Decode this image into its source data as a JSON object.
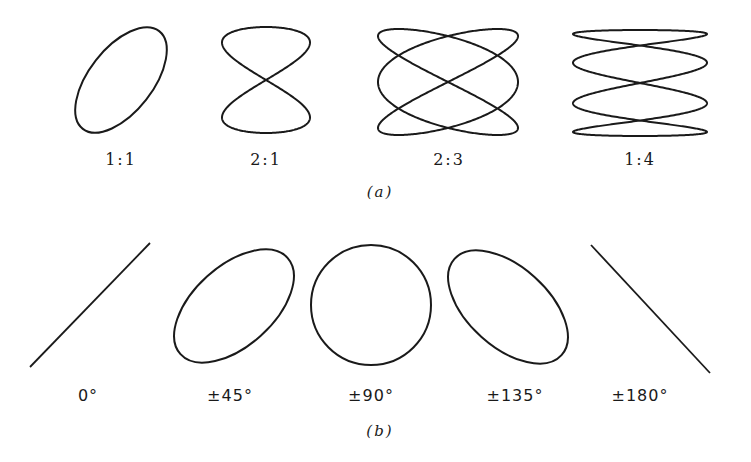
{
  "figure": {
    "part_a": {
      "label": "(a)",
      "items": [
        {
          "label": "1:1",
          "shape": "tilted-ellipse"
        },
        {
          "label": "2:1",
          "shape": "figure-eight"
        },
        {
          "label": "2:3",
          "shape": "lissajous-2-3"
        },
        {
          "label": "1:4",
          "shape": "lissajous-1-4"
        }
      ]
    },
    "part_b": {
      "label": "(b)",
      "items": [
        {
          "label": "0°",
          "shape": "diagonal-line-rising"
        },
        {
          "label": "±45°",
          "shape": "tilted-ellipse-right"
        },
        {
          "label": "±90°",
          "shape": "circle"
        },
        {
          "label": "±135°",
          "shape": "tilted-ellipse-left"
        },
        {
          "label": "±180°",
          "shape": "diagonal-line-falling"
        }
      ]
    },
    "stroke_color": "#1a1a1a",
    "background": "#ffffff"
  }
}
